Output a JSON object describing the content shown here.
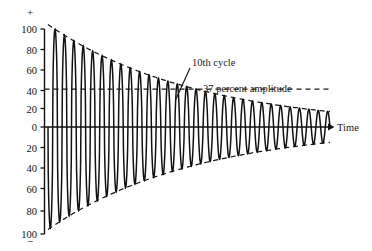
{
  "chart_data": {
    "type": "line",
    "title": "",
    "subtitle": "",
    "xlabel": "Time",
    "ylabel": "",
    "ylim": [
      -100,
      100
    ],
    "xlim": [
      0,
      30
    ],
    "grid": false,
    "legend": "none",
    "axis": {
      "positive_sign": "+",
      "negative_sign": "−",
      "y_ticks": [
        100,
        80,
        60,
        40,
        20,
        0,
        20,
        40,
        60,
        80,
        100
      ],
      "y_tick_labels": [
        "100",
        "80",
        "60",
        "40",
        "20",
        "0",
        "20",
        "40",
        "60",
        "80",
        "100"
      ],
      "y_tick_values": [
        100,
        80,
        60,
        40,
        20,
        0,
        -20,
        -40,
        -60,
        -80,
        -100
      ],
      "x_axis_arrow": true
    },
    "series": [
      {
        "name": "damped oscillation",
        "description": "exponentially decaying sinusoid",
        "initial_amplitude": 100,
        "final_amplitude": 15,
        "cycles": 30,
        "decay_constant_per_cycle": 0.0634,
        "amplitude_at_10th_cycle": 37
      }
    ],
    "envelope": {
      "type": "exponential",
      "upper_start": 100,
      "upper_end": 15,
      "lower_start": -100,
      "lower_end": -15,
      "style": "dashed"
    },
    "reference_lines": [
      {
        "name": "37-percent-amplitude",
        "value": 37,
        "orientation": "horizontal",
        "style": "dashed"
      },
      {
        "name": "zero-line",
        "value": 0,
        "orientation": "horizontal",
        "style": "solid"
      }
    ],
    "annotations": [
      {
        "name": "tenth-cycle",
        "text": "10th cycle",
        "x_px": 192,
        "y_px": 62,
        "leader_to_x": 180,
        "leader_to_y": 96
      },
      {
        "name": "thirty-seven-percent-amplitude",
        "text": "37 percent amplitude",
        "x_px": 202,
        "y_px": 90
      },
      {
        "name": "time-axis",
        "text": "Time",
        "x_px": 333,
        "y_px": 130
      }
    ]
  },
  "labels": {
    "plus_sign": "+",
    "minus_sign": "−",
    "y_ticks": [
      "100",
      "80",
      "60",
      "40",
      "20",
      "0",
      "20",
      "40",
      "60",
      "80",
      "100"
    ],
    "tenth_cycle": "10th cycle",
    "percent_amplitude": "37 percent amplitude",
    "time": "Time"
  },
  "colors": {
    "background": "#ffffff",
    "ink": "#111111",
    "dashed": "#1a1a1a"
  }
}
